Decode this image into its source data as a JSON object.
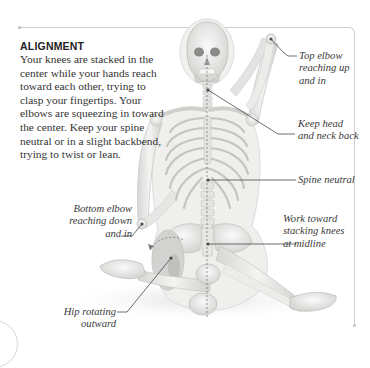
{
  "intro": {
    "heading": "ALIGNMENT",
    "body": "Your knees are stacked in the center while your hands reach toward each other, trying to clasp your fingertips. Your elbows are squeezing in toward the center. Keep your spine neutral or in a slight backbend, trying to twist or lean."
  },
  "callouts": {
    "top_elbow": [
      "Top elbow",
      "reaching up",
      "and in"
    ],
    "head_neck": [
      "Keep head",
      "and neck back"
    ],
    "spine": [
      "Spine neutral"
    ],
    "knees": [
      "Work toward",
      "stacking knees",
      "at midline"
    ],
    "bottom_elbow": [
      "Bottom elbow",
      "reaching down",
      "and in"
    ],
    "hip": [
      "Hip rotating",
      "outward"
    ]
  },
  "figure": {
    "bone_color": "#e8e8e6",
    "bone_shade": "#c9c9c6",
    "body_outline_color": "#dcdcda",
    "leader_line_color": "#4a4a4a"
  }
}
